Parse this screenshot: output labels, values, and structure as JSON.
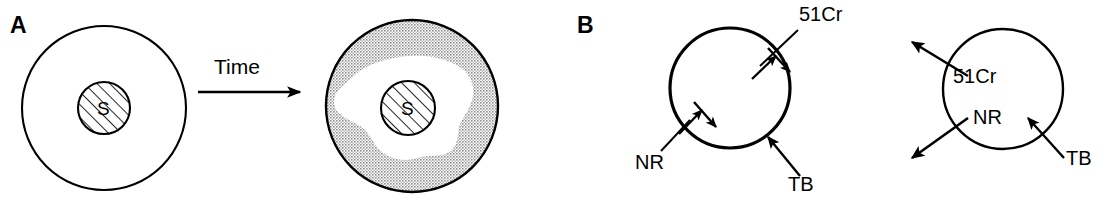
{
  "figure": {
    "panels": [
      {
        "id": "panel-a",
        "letter": "A",
        "time_arrow_label": "Time",
        "cells": [
          {
            "id": "cell-a-before",
            "nucleus_label": "S",
            "cytoplasm_fill": "white"
          },
          {
            "id": "cell-a-after",
            "nucleus_label": "S",
            "cytoplasm_fill": "stippled-gray"
          }
        ]
      },
      {
        "id": "panel-b",
        "letter": "B",
        "cells": [
          {
            "id": "cell-b-influx",
            "labels": {
              "tracer": "51Cr",
              "dye": "NR",
              "membrane": "TB"
            },
            "transport": "influx"
          },
          {
            "id": "cell-b-efflux",
            "labels": {
              "tracer": "51Cr",
              "dye": "NR",
              "membrane": "TB"
            },
            "transport": "efflux"
          }
        ]
      }
    ],
    "colors": {
      "ink": "#000000",
      "background": "#ffffff",
      "stipple_gray": "#a8a8a8",
      "halo_white": "#ffffff"
    }
  }
}
